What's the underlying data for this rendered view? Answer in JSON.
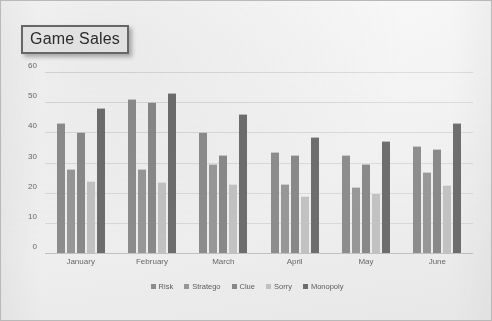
{
  "title": "Game Sales",
  "chart_data": {
    "type": "bar",
    "title": "Game Sales",
    "xlabel": "",
    "ylabel": "",
    "ylim": [
      0,
      60
    ],
    "yticks": [
      60,
      50,
      40,
      30,
      20,
      10,
      0
    ],
    "grid": true,
    "legend_position": "bottom",
    "categories": [
      "January",
      "February",
      "March",
      "April",
      "May",
      "June"
    ],
    "series": [
      {
        "name": "Risk",
        "color": "#8f8f8f",
        "values": [
          43,
          51,
          40,
          33.5,
          32.5,
          35.5
        ]
      },
      {
        "name": "Stratego",
        "color": "#9a9a9a",
        "values": [
          28,
          28,
          29.5,
          23,
          22,
          27
        ]
      },
      {
        "name": "Clue",
        "color": "#8b8b8b",
        "values": [
          40,
          50,
          32.5,
          32.5,
          29.5,
          34.5
        ]
      },
      {
        "name": "Sorry",
        "color": "#c5c5c5",
        "values": [
          24,
          23.5,
          23,
          19,
          20,
          22.5
        ]
      },
      {
        "name": "Monopoly",
        "color": "#6f6f6f",
        "values": [
          48,
          53,
          46,
          38.5,
          37,
          43
        ]
      }
    ]
  },
  "colors": {
    "frame_border": "#b9b9b9",
    "gridline": "#dcdcdc",
    "tick_text": "#6a6a6a",
    "title_border": "#6d6d6d"
  }
}
